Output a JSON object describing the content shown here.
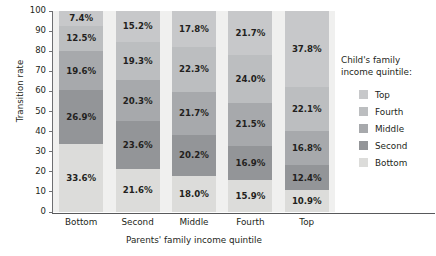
{
  "chart_data": {
    "type": "bar",
    "subtype": "stacked-column-100",
    "title": "",
    "xlabel": "Parents' family income quintile",
    "ylabel": "Transition rate",
    "ylim": [
      0,
      100
    ],
    "yticks": [
      0,
      10,
      20,
      30,
      40,
      50,
      60,
      70,
      80,
      90,
      100
    ],
    "grid": false,
    "legend_position": "right",
    "legend_title": "Child's family income quintile:",
    "categories": [
      "Bottom",
      "Second",
      "Middle",
      "Fourth",
      "Top"
    ],
    "series": [
      {
        "name": "Bottom",
        "color": "#dcdcda",
        "values": [
          33.6,
          21.6,
          18.0,
          15.9,
          10.9
        ]
      },
      {
        "name": "Second",
        "color": "#939598",
        "values": [
          26.9,
          23.6,
          20.2,
          16.9,
          12.4
        ]
      },
      {
        "name": "Middle",
        "color": "#a7a9ac",
        "values": [
          19.6,
          20.3,
          21.7,
          21.5,
          16.8
        ]
      },
      {
        "name": "Fourth",
        "color": "#bcbec0",
        "values": [
          12.5,
          19.3,
          22.3,
          24.0,
          22.1
        ]
      },
      {
        "name": "Top",
        "color": "#c7c8ca",
        "values": [
          7.4,
          15.2,
          17.8,
          21.7,
          37.8
        ]
      }
    ],
    "data_labels": {
      "Bottom": [
        "7.4%",
        "12.5%",
        "19.6%",
        "26.9%",
        "33.6%"
      ],
      "Second": [
        "15.2%",
        "19.3%",
        "20.3%",
        "23.6%",
        "21.6%"
      ],
      "Middle": [
        "17.8%",
        "22.3%",
        "21.7%",
        "20.2%",
        "18.0%"
      ],
      "Fourth": [
        "21.7%",
        "24.0%",
        "21.5%",
        "16.9%",
        "15.9%"
      ],
      "Top": [
        "37.8%",
        "22.1%",
        "16.8%",
        "12.4%",
        "10.9%"
      ]
    }
  },
  "legend": {
    "title": "Child's family income quintile:",
    "items": [
      {
        "label": "Top",
        "color": "#c7c8ca"
      },
      {
        "label": "Fourth",
        "color": "#bcbec0"
      },
      {
        "label": "Middle",
        "color": "#a7a9ac"
      },
      {
        "label": "Second",
        "color": "#939598"
      },
      {
        "label": "Bottom",
        "color": "#dcdcda"
      }
    ]
  },
  "axes": {
    "y_title": "Transition rate",
    "x_title": "Parents' family income quintile",
    "y_tick_labels": [
      "100",
      "90",
      "80",
      "70",
      "60",
      "50",
      "40",
      "30",
      "20",
      "10",
      "0"
    ],
    "x_tick_labels": [
      "Bottom",
      "Second",
      "Middle",
      "Fourth",
      "Top"
    ]
  }
}
